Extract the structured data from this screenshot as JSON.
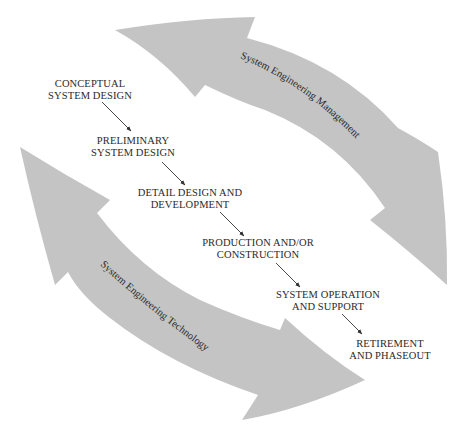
{
  "diagram": {
    "type": "life-cycle flow",
    "colors": {
      "background": "#ffffff",
      "band_fill": "#c4c4c4",
      "text": "#2a2a2a",
      "connector": "#333333"
    },
    "bands": [
      {
        "id": "management",
        "label": "System Engineering Management"
      },
      {
        "id": "technology",
        "label": "System Engineering Technology"
      }
    ],
    "phases": [
      {
        "line1": "CONCEPTUAL",
        "line2": "SYSTEM DESIGN"
      },
      {
        "line1": "PRELIMINARY",
        "line2": "SYSTEM DESIGN"
      },
      {
        "line1": "DETAIL DESIGN AND",
        "line2": "DEVELOPMENT"
      },
      {
        "line1": "PRODUCTION AND/OR",
        "line2": "CONSTRUCTION"
      },
      {
        "line1": "SYSTEM OPERATION",
        "line2": "AND SUPPORT"
      },
      {
        "line1": "RETIREMENT",
        "line2": "AND PHASEOUT"
      }
    ]
  }
}
